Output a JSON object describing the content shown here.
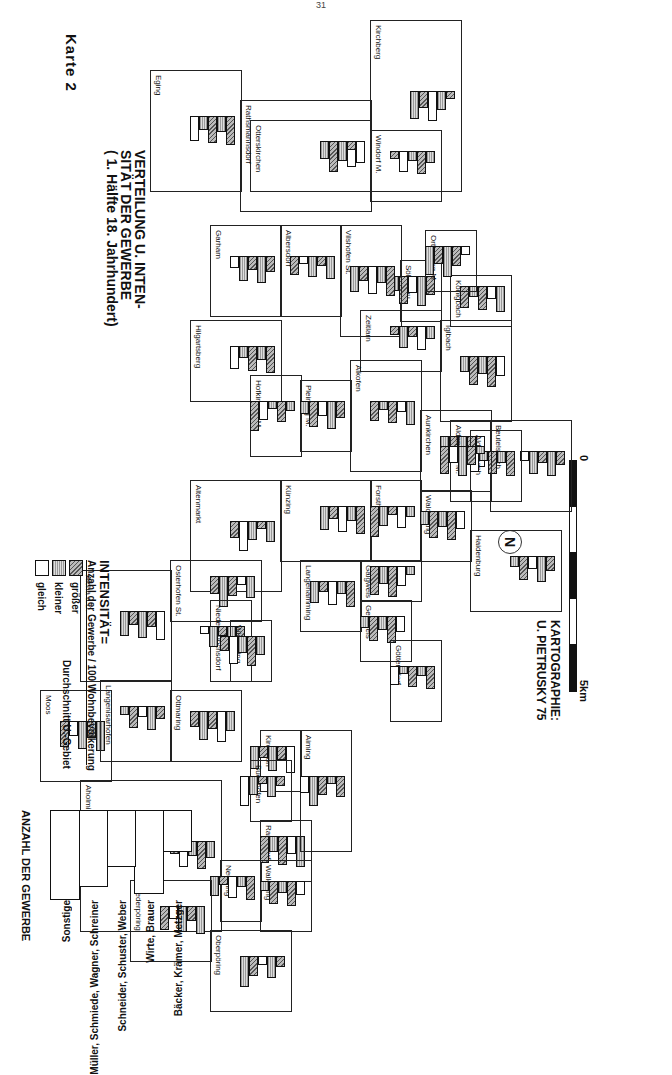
{
  "page_number": "31",
  "map": {
    "label": "Karte 2",
    "title_lines": [
      "VERTEILUNG U. INTEN-",
      "SITÄT DER GEWERBE",
      "( 1. Hälfte 18. Jahrhundert)"
    ],
    "credit_lines": [
      "KARTOGRAPHIE:",
      "U. PIETRUSKY 75"
    ],
    "scale": {
      "start": "0",
      "end": "5km"
    },
    "north_symbol": "N"
  },
  "legend": {
    "title": "INTENSITÄT=",
    "formula": "Anzahl der Gewerbe / 100 Wohnbevölkerung",
    "categories": [
      {
        "key": "groesser",
        "label": "größer",
        "pattern": "dense-hatch"
      },
      {
        "key": "kleiner",
        "label": "kleiner",
        "pattern": "light-dot"
      },
      {
        "key": "gleich",
        "label": "gleich",
        "pattern": "empty"
      }
    ],
    "comparison": "Durchschnitt U.-Gebiet"
  },
  "key_chart": {
    "axis_label": "ANZAHL DER GEWERBE",
    "ticks": [
      "0",
      "10",
      "20",
      "30"
    ],
    "categories": [
      "Bäcker, Krämer, Metzger",
      "Wirte, Brauer",
      "Schneider, Schuster, Weber",
      "Müller, Schmiede, Wagner, Schreiner",
      "Sonstige"
    ]
  },
  "regions": [
    {
      "name": "Kirchberg",
      "x": 20,
      "y": 210,
      "w": 170,
      "h": 90
    },
    {
      "name": "Otterskirchen",
      "x": 120,
      "y": 300,
      "w": 70,
      "h": 120
    },
    {
      "name": "Rathsmannsdorf",
      "x": 100,
      "y": 300,
      "w": 110,
      "h": 130
    },
    {
      "name": "Eging",
      "x": 70,
      "y": 430,
      "w": 120,
      "h": 90
    },
    {
      "name": "Windorf M.",
      "x": 130,
      "y": 230,
      "w": 70,
      "h": 70
    },
    {
      "name": "Söldenau",
      "x": 260,
      "y": 230,
      "w": 60,
      "h": 40
    },
    {
      "name": "Königbach",
      "x": 275,
      "y": 160,
      "w": 50,
      "h": 60
    },
    {
      "name": "Ortenburg M.",
      "x": 230,
      "y": 195,
      "w": 60,
      "h": 50
    },
    {
      "name": "Garham",
      "x": 225,
      "y": 390,
      "w": 90,
      "h": 70
    },
    {
      "name": "Albersdorf",
      "x": 225,
      "y": 330,
      "w": 90,
      "h": 60
    },
    {
      "name": "Vilshofen St.",
      "x": 225,
      "y": 270,
      "w": 110,
      "h": 60
    },
    {
      "name": "Zeitlarn",
      "x": 310,
      "y": 230,
      "w": 60,
      "h": 80
    },
    {
      "name": "Iglbach",
      "x": 320,
      "y": 160,
      "w": 100,
      "h": 70
    },
    {
      "name": "Hilgartsberg",
      "x": 320,
      "y": 390,
      "w": 80,
      "h": 90
    },
    {
      "name": "Hofkirchen M.",
      "x": 375,
      "y": 370,
      "w": 80,
      "h": 50
    },
    {
      "name": "Pleinting M.",
      "x": 380,
      "y": 320,
      "w": 70,
      "h": 50
    },
    {
      "name": "Alkofen",
      "x": 360,
      "y": 250,
      "w": 110,
      "h": 70
    },
    {
      "name": "Aunkirchen",
      "x": 410,
      "y": 180,
      "w": 80,
      "h": 70
    },
    {
      "name": "Beutelsbach",
      "x": 420,
      "y": 100,
      "w": 90,
      "h": 80
    },
    {
      "name": "Altenmarkt",
      "x": 480,
      "y": 390,
      "w": 110,
      "h": 90
    },
    {
      "name": "Künzing",
      "x": 480,
      "y": 300,
      "w": 80,
      "h": 90
    },
    {
      "name": "Forsthart",
      "x": 480,
      "y": 250,
      "w": 80,
      "h": 50
    },
    {
      "name": "Walchsang",
      "x": 490,
      "y": 200,
      "w": 70,
      "h": 50
    },
    {
      "name": "Aldersbach",
      "x": 430,
      "y": 150,
      "w": 70,
      "h": 50
    },
    {
      "name": "Aldenbach M.",
      "x": 420,
      "y": 180,
      "w": 80,
      "h": 40
    },
    {
      "name": "Haidenburg",
      "x": 530,
      "y": 110,
      "w": 80,
      "h": 90
    },
    {
      "name": "Osterhofen St.",
      "x": 560,
      "y": 410,
      "w": 60,
      "h": 90
    },
    {
      "name": "Aicha a.D.",
      "x": 570,
      "y": 500,
      "w": 110,
      "h": 90
    },
    {
      "name": "Niedermünchsdorf",
      "x": 600,
      "y": 420,
      "w": 80,
      "h": 40
    },
    {
      "name": "Wisselsing",
      "x": 620,
      "y": 400,
      "w": 60,
      "h": 40
    },
    {
      "name": "Langenamming",
      "x": 560,
      "y": 310,
      "w": 70,
      "h": 60
    },
    {
      "name": "Galgweis",
      "x": 560,
      "y": 250,
      "w": 40,
      "h": 60
    },
    {
      "name": "Gergweis",
      "x": 600,
      "y": 260,
      "w": 60,
      "h": 50
    },
    {
      "name": "Göttersdorf",
      "x": 640,
      "y": 230,
      "w": 80,
      "h": 50
    },
    {
      "name": "Moos",
      "x": 690,
      "y": 560,
      "w": 90,
      "h": 70
    },
    {
      "name": "Langenisarhofen",
      "x": 680,
      "y": 500,
      "w": 80,
      "h": 70
    },
    {
      "name": "Ottmaring",
      "x": 690,
      "y": 430,
      "w": 70,
      "h": 70
    },
    {
      "name": "Kirchdorf",
      "x": 730,
      "y": 370,
      "w": 60,
      "h": 40
    },
    {
      "name": "Buchhofen",
      "x": 760,
      "y": 380,
      "w": 60,
      "h": 40
    },
    {
      "name": "Aholming",
      "x": 780,
      "y": 450,
      "w": 150,
      "h": 140
    },
    {
      "name": "Neusling",
      "x": 860,
      "y": 410,
      "w": 60,
      "h": 40
    },
    {
      "name": "Ramsdorf",
      "x": 820,
      "y": 360,
      "w": 60,
      "h": 50
    },
    {
      "name": "Wallerfing",
      "x": 860,
      "y": 360,
      "w": 70,
      "h": 50
    },
    {
      "name": "Aiming",
      "x": 730,
      "y": 320,
      "w": 120,
      "h": 50
    },
    {
      "name": "Niederpöring",
      "x": 880,
      "y": 460,
      "w": 80,
      "h": 80
    },
    {
      "name": "Oberpöring",
      "x": 930,
      "y": 380,
      "w": 80,
      "h": 80
    }
  ]
}
